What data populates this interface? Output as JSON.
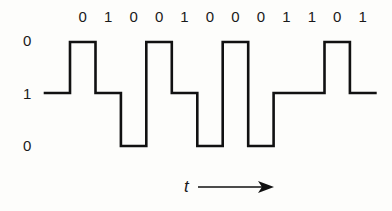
{
  "diagram": {
    "type": "line-coded-waveform",
    "bits": [
      "0",
      "1",
      "0",
      "0",
      "1",
      "0",
      "0",
      "0",
      "1",
      "1",
      "0",
      "1"
    ],
    "level_labels": [
      {
        "text": "0",
        "level": "high"
      },
      {
        "text": "1",
        "level": "mid"
      },
      {
        "text": "0",
        "level": "low"
      }
    ],
    "initial_level": "mid",
    "waveform_levels": [
      "high",
      "mid",
      "low",
      "high",
      "mid",
      "low",
      "high",
      "low",
      "mid",
      "mid",
      "high",
      "mid"
    ],
    "time_axis_label": "t"
  }
}
